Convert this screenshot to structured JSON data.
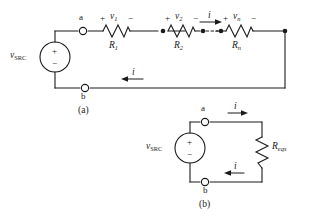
{
  "figure": {
    "type": "circuit-diagram",
    "stroke_color": "#1a1a1a",
    "background_color": "#ffffff"
  },
  "circuit_a": {
    "caption": "(a)",
    "source": {
      "label_v": "v",
      "label_sub": "SRC",
      "plus": "+",
      "minus": "−"
    },
    "terminals": {
      "top": "a",
      "bottom": "b"
    },
    "elements": [
      {
        "name": "R1",
        "r_label": "R",
        "r_sub": "1",
        "v_label": "v",
        "v_sub": "1",
        "plus": "+",
        "minus": "−"
      },
      {
        "name": "R2",
        "r_label": "R",
        "r_sub": "2",
        "v_label": "v",
        "v_sub": "2",
        "plus": "+",
        "minus": "−"
      },
      {
        "name": "Rn",
        "r_label": "R",
        "r_sub": "n",
        "v_label": "v",
        "v_sub": "n",
        "plus": "+",
        "minus": "−"
      }
    ],
    "current_top": {
      "label": "i",
      "direction": "right"
    },
    "current_bottom": {
      "label": "i",
      "direction": "left"
    }
  },
  "circuit_b": {
    "caption": "(b)",
    "source": {
      "label_v": "v",
      "label_sub": "SRC",
      "plus": "+",
      "minus": "−"
    },
    "terminals": {
      "top": "a",
      "bottom": "b"
    },
    "resistor": {
      "r_label": "R",
      "r_sub": "eqs"
    },
    "current_top": {
      "label": "i",
      "direction": "right"
    },
    "current_bottom": {
      "label": "i",
      "direction": "left"
    }
  }
}
